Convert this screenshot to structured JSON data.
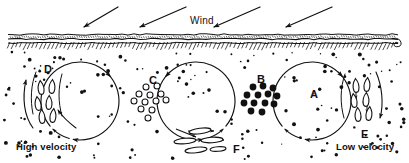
{
  "figure": {
    "background_color": "#ffffff",
    "ink_color": "#111111",
    "width": 409,
    "height": 163
  },
  "wind": {
    "label": "Wind",
    "label_x": 190,
    "label_y": 15,
    "direction": "right-to-left, downward toward ground",
    "arrows": [
      {
        "x1": 118,
        "y1": 7,
        "x2": 84,
        "y2": 27
      },
      {
        "x1": 186,
        "y1": 7,
        "x2": 140,
        "y2": 27
      },
      {
        "x1": 260,
        "y1": 7,
        "x2": 214,
        "y2": 27
      },
      {
        "x1": 332,
        "y1": 7,
        "x2": 286,
        "y2": 27
      }
    ]
  },
  "ground": {
    "name": "soil-surface",
    "top_y": 33,
    "bottom_y": 50,
    "left_x": 8,
    "right_x": 398,
    "hatch_count": 96
  },
  "vortices": [
    {
      "id": "left-vortex",
      "cx": 80,
      "cy": 101,
      "r": 39,
      "rotation": "clockwise",
      "gap_start_deg": 100,
      "gap_end_deg": 140
    },
    {
      "id": "middle-vortex",
      "cx": 196,
      "cy": 101,
      "r": 39,
      "rotation": "counterclockwise",
      "gap_start_deg": 40,
      "gap_end_deg": 80
    },
    {
      "id": "right-vortex",
      "cx": 312,
      "cy": 101,
      "r": 39,
      "rotation": "clockwise",
      "gap_start_deg": 100,
      "gap_end_deg": 140
    }
  ],
  "regions": [
    {
      "key": "A",
      "label": "A",
      "label_x": 310,
      "label_y": 88,
      "description": "vortex interior with fine scattered particles"
    },
    {
      "key": "B",
      "label": "B",
      "label_x": 257,
      "label_y": 73,
      "description": "cluster of large filled dark particles between vortices",
      "particle_style": "filled",
      "particle_count": 13,
      "particles": [
        {
          "x": 253,
          "y": 87,
          "r": 3.4
        },
        {
          "x": 263,
          "y": 86,
          "r": 3.4
        },
        {
          "x": 273,
          "y": 88,
          "r": 3.4
        },
        {
          "x": 247,
          "y": 95,
          "r": 3.4
        },
        {
          "x": 258,
          "y": 95,
          "r": 3.4
        },
        {
          "x": 268,
          "y": 94,
          "r": 3.4
        },
        {
          "x": 277,
          "y": 96,
          "r": 3.4
        },
        {
          "x": 244,
          "y": 103,
          "r": 3.4
        },
        {
          "x": 254,
          "y": 103,
          "r": 3.4
        },
        {
          "x": 265,
          "y": 103,
          "r": 3.4
        },
        {
          "x": 274,
          "y": 104,
          "r": 3.4
        },
        {
          "x": 251,
          "y": 111,
          "r": 3.4
        },
        {
          "x": 262,
          "y": 112,
          "r": 3.4
        }
      ]
    },
    {
      "key": "C",
      "label": "C",
      "label_x": 149,
      "label_y": 74,
      "description": "cluster of hollow open-circle particles between vortices",
      "particle_style": "hollow",
      "particle_count": 12,
      "particles": [
        {
          "x": 146,
          "y": 87,
          "r": 3.0
        },
        {
          "x": 157,
          "y": 86,
          "r": 3.0
        },
        {
          "x": 139,
          "y": 94,
          "r": 3.0
        },
        {
          "x": 150,
          "y": 95,
          "r": 3.0
        },
        {
          "x": 161,
          "y": 94,
          "r": 3.0
        },
        {
          "x": 134,
          "y": 101,
          "r": 3.0
        },
        {
          "x": 145,
          "y": 102,
          "r": 3.0
        },
        {
          "x": 156,
          "y": 101,
          "r": 3.0
        },
        {
          "x": 166,
          "y": 100,
          "r": 3.0
        },
        {
          "x": 141,
          "y": 109,
          "r": 3.0
        },
        {
          "x": 152,
          "y": 110,
          "r": 3.0
        },
        {
          "x": 148,
          "y": 118,
          "r": 3.0
        }
      ]
    },
    {
      "key": "D",
      "label": "D",
      "label_x": 44,
      "label_y": 63,
      "description": "vertical teardrop grains rising between vortex and edge",
      "particle_style": "teardrop",
      "particle_count": 6,
      "particles": [
        {
          "x": 41,
          "y": 88,
          "rot": -6
        },
        {
          "x": 52,
          "y": 87,
          "rot": 4
        },
        {
          "x": 38,
          "y": 104,
          "rot": -8
        },
        {
          "x": 49,
          "y": 103,
          "rot": 2
        },
        {
          "x": 42,
          "y": 117,
          "rot": -4
        },
        {
          "x": 53,
          "y": 116,
          "rot": 6
        }
      ]
    },
    {
      "key": "E",
      "label": "E",
      "label_x": 361,
      "label_y": 128,
      "description": "vertical teardrop grains descending near right edge",
      "particle_style": "teardrop",
      "particle_count": 6,
      "particles": [
        {
          "x": 356,
          "y": 86,
          "rot": -4
        },
        {
          "x": 367,
          "y": 85,
          "rot": 5
        },
        {
          "x": 354,
          "y": 101,
          "rot": -6
        },
        {
          "x": 366,
          "y": 100,
          "rot": 3
        },
        {
          "x": 358,
          "y": 115,
          "rot": -3
        },
        {
          "x": 369,
          "y": 114,
          "rot": 6
        }
      ]
    },
    {
      "key": "F",
      "label": "F",
      "label_x": 233,
      "label_y": 143,
      "description": "flat lens-shaped grains travelling horizontally with arrows",
      "particle_style": "lens",
      "particle_count": 5,
      "particles": [
        {
          "x": 200,
          "y": 131,
          "w": 22,
          "h": 5.5,
          "rot": -7
        },
        {
          "x": 185,
          "y": 141,
          "w": 22,
          "h": 5.5,
          "rot": -5
        },
        {
          "x": 212,
          "y": 140,
          "w": 22,
          "h": 5.5,
          "rot": -3
        },
        {
          "x": 196,
          "y": 150,
          "w": 22,
          "h": 5.5,
          "rot": -6
        },
        {
          "x": 218,
          "y": 149,
          "w": 16,
          "h": 4.5,
          "rot": -4
        }
      ]
    }
  ],
  "velocity_labels": [
    {
      "key": "high",
      "text": "High velocity",
      "x": 16,
      "y": 141
    },
    {
      "key": "low",
      "text": "Low velocity",
      "x": 336,
      "y": 141
    }
  ],
  "background_dots": {
    "description": "fine scattered sand grains filling the air space below the ground line",
    "count": 168,
    "radius_min": 0.7,
    "radius_max": 2.0,
    "region": {
      "x": 4,
      "y": 52,
      "width": 401,
      "height": 108
    }
  }
}
